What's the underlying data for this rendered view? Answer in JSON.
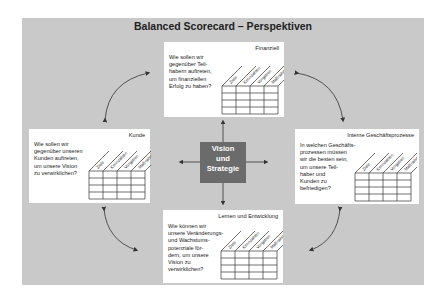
{
  "title": "Balanced Scorecard – Perspektiven",
  "center": {
    "lines": [
      "Vision",
      "und",
      "Strategie"
    ]
  },
  "columns": [
    "Ziele",
    "Kennzahlen",
    "Vorgaben",
    "Maßnahmen"
  ],
  "perspectives": {
    "finanziell": {
      "heading": "Finanziell",
      "question": "Wie sollen wir\ngegenüber Teil-\nhabern auftreten,\num finanziellen\nErfolg zu haben?"
    },
    "kunde": {
      "heading": "Kunde",
      "question": "Wie sollen wir\ngegenüber unseren\nKunden auftreten,\num unsere Vision\nzu verwirklichen?"
    },
    "prozesse": {
      "heading": "Interne Geschäftsprozesse",
      "question": "In welchen Geschäfts-\nprozessen müssen\nwir die besten sein,\num unsere Teil-\nhaber und\nKunden zu\nbefriedigen?"
    },
    "lernen": {
      "heading": "Lernen und Entwicklung",
      "question": "Wie können wir\nunsere Veränderungs-\nund Wachstums-\npotenziale för-\ndern, um unsere\nVision zu\nverwirklichen?"
    }
  },
  "colors": {
    "background": "#c9c9c9",
    "box": "#ffffff",
    "center": "#6b6b6b",
    "lines": "#333333"
  }
}
